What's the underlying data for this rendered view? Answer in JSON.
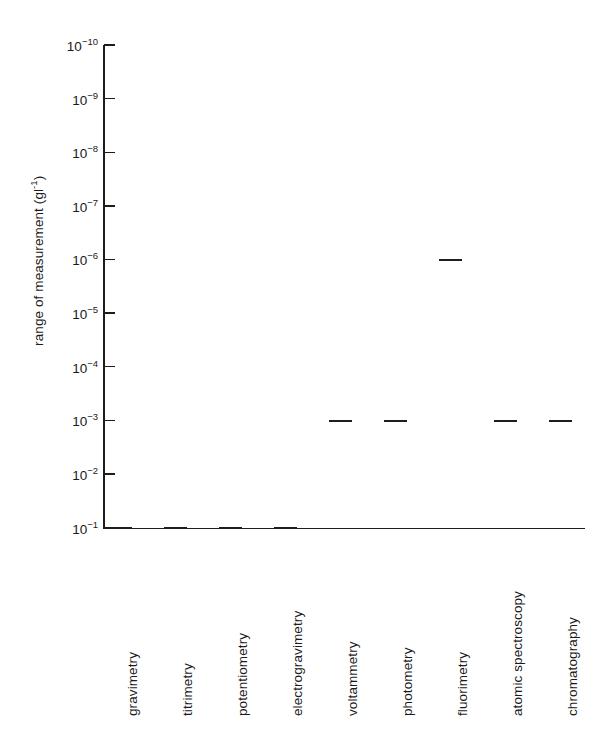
{
  "chart_data": {
    "type": "bar",
    "title": "",
    "xlabel": "",
    "ylabel": "range of measurement (g l⁻¹)",
    "ylabel_html": "range of measurement (gl<sup>-1</sup>)",
    "scale": "log",
    "ylim": [
      1e-10,
      0.1
    ],
    "y_axis_direction": "inverted (10^-10 at top, 10^-1 at bottom)",
    "grid": false,
    "legend": "none",
    "tick_labels": [
      "10⁻¹⁰",
      "10⁻⁹",
      "10⁻⁸",
      "10⁻⁷",
      "10⁻⁶",
      "10⁻⁵",
      "10⁻⁴",
      "10⁻³",
      "10⁻²",
      "10⁻¹"
    ],
    "tick_exponents": [
      -10,
      -9,
      -8,
      -7,
      -6,
      -5,
      -4,
      -3,
      -2,
      -1
    ],
    "categories": [
      "gravimetry",
      "titrimetry",
      "potentiometry",
      "electrogravimetry",
      "voltammetry",
      "photometry",
      "fluorimetry",
      "atomic spectroscopy",
      "chromatography"
    ],
    "series": [
      {
        "name": "range of measurement",
        "bars": [
          {
            "category": "gravimetry",
            "low_exp": -2,
            "high_exp": -1,
            "low": 0.01,
            "high": 0.1
          },
          {
            "category": "titrimetry",
            "low_exp": -4,
            "high_exp": -1,
            "low": 0.0001,
            "high": 0.1
          },
          {
            "category": "potentiometry",
            "low_exp": -6,
            "high_exp": -1,
            "low": 1e-06,
            "high": 0.1
          },
          {
            "category": "electrogravimetry",
            "low_exp": -4,
            "high_exp": -1,
            "low": 0.0001,
            "high": 0.1
          },
          {
            "category": "voltammetry",
            "low_exp": -10,
            "high_exp": -3,
            "low": 1e-10,
            "high": 0.001
          },
          {
            "category": "photometry",
            "low_exp": -6,
            "high_exp": -3,
            "low": 1e-06,
            "high": 0.001
          },
          {
            "category": "fluorimetry",
            "low_exp": -9,
            "high_exp": -6,
            "low": 1e-09,
            "high": 1e-06
          },
          {
            "category": "atomic spectroscopy",
            "low_exp": -9,
            "high_exp": -3,
            "low": 1e-09,
            "high": 0.001
          },
          {
            "category": "chromatography",
            "low_exp": -9.1,
            "high_exp": -3,
            "low": 1.2e-09,
            "high": 0.001
          }
        ]
      }
    ]
  },
  "colors": {
    "ink": "#1d1d1d",
    "background": "#ffffff"
  }
}
